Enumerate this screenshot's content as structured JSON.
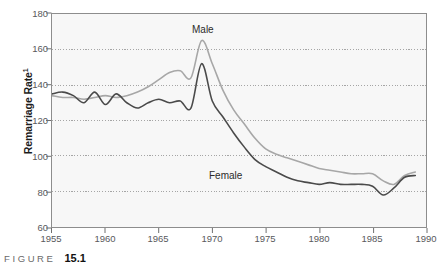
{
  "figure": {
    "caption_word": "FIGURE",
    "caption_number": "15.1"
  },
  "axis": {
    "y_title": "Remarriage Rate",
    "y_title_superscript": "1",
    "y_ticks": [
      "180",
      "160",
      "140",
      "120",
      "100",
      "80",
      "60"
    ],
    "x_ticks": [
      "1955",
      "1960",
      "1965",
      "1970",
      "1975",
      "1980",
      "1985",
      "1990"
    ]
  },
  "annotations": {
    "male_label": "Male",
    "female_label": "Female"
  },
  "colors": {
    "male_line": "#a7a7a7",
    "female_line": "#4a4a4a",
    "plot_background": "#f7f7f7",
    "plot_border": "#8d8d8d",
    "gridline": "#9a9a9a",
    "tick_text": "#58595b"
  },
  "chart_data": {
    "type": "line",
    "title": "",
    "xlabel": "",
    "ylabel": "Remarriage Rate",
    "xlim": [
      1955,
      1990
    ],
    "ylim": [
      60,
      180
    ],
    "y_tick_values": [
      60,
      80,
      100,
      120,
      140,
      160,
      180
    ],
    "x_tick_values": [
      1955,
      1960,
      1965,
      1970,
      1975,
      1980,
      1985,
      1990
    ],
    "grid": "horizontal-dotted",
    "legend": "inline-annotations",
    "x": [
      1955,
      1956,
      1957,
      1958,
      1959,
      1960,
      1961,
      1962,
      1963,
      1964,
      1965,
      1966,
      1967,
      1968,
      1969,
      1970,
      1971,
      1972,
      1973,
      1974,
      1975,
      1976,
      1977,
      1978,
      1979,
      1980,
      1981,
      1982,
      1983,
      1984,
      1985,
      1986,
      1987,
      1988,
      1989
    ],
    "series": [
      {
        "name": "Male",
        "color": "#a7a7a7",
        "values": [
          134,
          133,
          133,
          132,
          133,
          134,
          133,
          134,
          136,
          139,
          143,
          147,
          148,
          144,
          165,
          152,
          137,
          126,
          118,
          110,
          104,
          101,
          99,
          97,
          95,
          93,
          92,
          91,
          90,
          90,
          90,
          86,
          84,
          89,
          91
        ]
      },
      {
        "name": "Female",
        "color": "#4a4a4a",
        "values": [
          135,
          136,
          134,
          130,
          136,
          129,
          135,
          130,
          127,
          130,
          132,
          130,
          131,
          127,
          152,
          131,
          122,
          113,
          105,
          98,
          94,
          91,
          88,
          86,
          85,
          84,
          85,
          84,
          84,
          84,
          83,
          78,
          82,
          88,
          89
        ]
      }
    ]
  }
}
